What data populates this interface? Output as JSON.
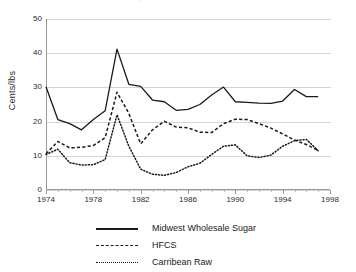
{
  "chart_data": {
    "type": "line",
    "title": "Sugar and Sweetener Prices",
    "xlabel": "",
    "ylabel": "Cents/lbs",
    "xlim": [
      1974,
      1998
    ],
    "ylim": [
      0,
      50
    ],
    "ytick_labels": [
      "0",
      "10",
      "20",
      "30",
      "40",
      "50"
    ],
    "ytick_values": [
      0,
      10,
      20,
      30,
      40,
      50
    ],
    "xtick_labels": [
      "1974",
      "1978",
      "1982",
      "1986",
      "1990",
      "1994",
      "1998"
    ],
    "xtick_values": [
      1974,
      1978,
      1982,
      1986,
      1990,
      1994,
      1998
    ],
    "grid": "horizontal",
    "legend_position": "bottom",
    "x": [
      1974,
      1975,
      1976,
      1977,
      1978,
      1979,
      1980,
      1981,
      1982,
      1983,
      1984,
      1985,
      1986,
      1987,
      1988,
      1989,
      1990,
      1991,
      1992,
      1993,
      1994,
      1995,
      1996,
      1997
    ],
    "series": [
      {
        "name": "Midwest Wholesale Sugar",
        "style": "solid",
        "color": "#1a1a1a",
        "values": [
          30.2,
          20.6,
          19.4,
          17.6,
          20.6,
          23.2,
          41.2,
          30.9,
          30.3,
          26.3,
          25.8,
          23.3,
          23.6,
          25.0,
          27.8,
          30.1,
          25.8,
          25.6,
          25.4,
          25.3,
          26.0,
          29.4,
          27.3,
          27.3
        ]
      },
      {
        "name": "HFCS",
        "style": "dashed",
        "color": "#1a1a1a",
        "values": [
          10.6,
          14.2,
          12.3,
          12.5,
          13.0,
          15.3,
          28.6,
          22.4,
          13.5,
          17.6,
          20.1,
          18.4,
          18.2,
          16.9,
          16.8,
          19.4,
          20.7,
          20.6,
          19.4,
          18.1,
          16.4,
          14.6,
          13.3,
          11.6
        ]
      },
      {
        "name": "Carribean Raw",
        "style": "dotted",
        "color": "#1a1a1a",
        "values": [
          10.4,
          11.9,
          8.0,
          7.3,
          7.4,
          8.9,
          22.0,
          12.8,
          6.1,
          4.6,
          4.3,
          5.1,
          6.8,
          7.8,
          10.4,
          12.8,
          13.2,
          10.0,
          9.5,
          10.2,
          12.8,
          14.4,
          14.8,
          11.5
        ]
      }
    ]
  }
}
